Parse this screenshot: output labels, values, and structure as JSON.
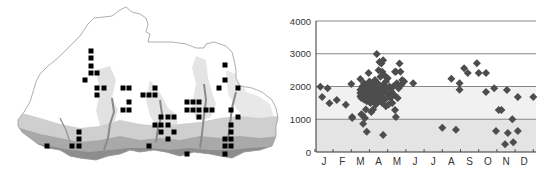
{
  "map": {
    "description": "Distribution map with occurrence grid squares over shaded relief",
    "outline_color": "#9a9a9a",
    "square_color": "#000000",
    "square_size": 5,
    "squares": [
      [
        91,
        51
      ],
      [
        91,
        58
      ],
      [
        91,
        66
      ],
      [
        91,
        73
      ],
      [
        97,
        73
      ],
      [
        85,
        80
      ],
      [
        97,
        88
      ],
      [
        104,
        88
      ],
      [
        97,
        95
      ],
      [
        123,
        88
      ],
      [
        129,
        88
      ],
      [
        129,
        102
      ],
      [
        123,
        110
      ],
      [
        129,
        110
      ],
      [
        143,
        95
      ],
      [
        149,
        95
      ],
      [
        155,
        95
      ],
      [
        155,
        88
      ],
      [
        161,
        117
      ],
      [
        168,
        117
      ],
      [
        174,
        117
      ],
      [
        155,
        125
      ],
      [
        161,
        125
      ],
      [
        168,
        125
      ],
      [
        161,
        132
      ],
      [
        174,
        132
      ],
      [
        168,
        139
      ],
      [
        149,
        146
      ],
      [
        187,
        102
      ],
      [
        193,
        102
      ],
      [
        199,
        102
      ],
      [
        187,
        110
      ],
      [
        193,
        110
      ],
      [
        199,
        110
      ],
      [
        206,
        110
      ],
      [
        212,
        110
      ],
      [
        199,
        117
      ],
      [
        187,
        154
      ],
      [
        225,
        65
      ],
      [
        225,
        80
      ],
      [
        219,
        88
      ],
      [
        238,
        88
      ],
      [
        231,
        110
      ],
      [
        238,
        117
      ],
      [
        231,
        125
      ],
      [
        231,
        132
      ],
      [
        225,
        139
      ],
      [
        231,
        139
      ],
      [
        225,
        146
      ],
      [
        231,
        146
      ],
      [
        225,
        154
      ],
      [
        79,
        132
      ],
      [
        79,
        139
      ],
      [
        79,
        146
      ],
      [
        72,
        146
      ],
      [
        47,
        146
      ]
    ]
  },
  "chart_data": {
    "type": "scatter",
    "title": "",
    "xlabel": "",
    "ylabel": "",
    "categories": [
      "J",
      "F",
      "M",
      "A",
      "M",
      "J",
      "J",
      "A",
      "S",
      "O",
      "N",
      "D"
    ],
    "yticks": [
      "0",
      "1000",
      "2000",
      "3000",
      "4000"
    ],
    "ylim": [
      0,
      4000
    ],
    "grid": true,
    "bands": [
      {
        "from": 0,
        "to": 1000,
        "color": "#e4e4e4"
      },
      {
        "from": 1000,
        "to": 2000,
        "color": "#f1f1f1"
      }
    ],
    "marker": "diamond",
    "marker_color": "#4d4d4d",
    "series": [
      {
        "name": "records",
        "points": [
          [
            -0.2,
            1990
          ],
          [
            -0.1,
            1680
          ],
          [
            0.2,
            1950
          ],
          [
            0.3,
            1490
          ],
          [
            0.7,
            1590
          ],
          [
            1.2,
            1440
          ],
          [
            1.5,
            2080
          ],
          [
            1.55,
            1040
          ],
          [
            2.0,
            2230
          ],
          [
            2.45,
            2410
          ],
          [
            2.9,
            2990
          ],
          [
            2.0,
            1900
          ],
          [
            2.0,
            1800
          ],
          [
            2.0,
            1700
          ],
          [
            2.05,
            1650
          ],
          [
            2.1,
            2000
          ],
          [
            2.1,
            1850
          ],
          [
            2.15,
            1750
          ],
          [
            2.2,
            1600
          ],
          [
            2.2,
            2100
          ],
          [
            2.25,
            1950
          ],
          [
            2.3,
            1800
          ],
          [
            2.3,
            1700
          ],
          [
            2.35,
            1550
          ],
          [
            2.4,
            2050
          ],
          [
            2.4,
            1900
          ],
          [
            2.45,
            1650
          ],
          [
            2.5,
            1800
          ],
          [
            2.5,
            2150
          ],
          [
            2.55,
            1500
          ],
          [
            2.6,
            1950
          ],
          [
            2.6,
            1700
          ],
          [
            2.65,
            1850
          ],
          [
            2.7,
            2050
          ],
          [
            2.7,
            1600
          ],
          [
            2.75,
            1750
          ],
          [
            2.8,
            1950
          ],
          [
            2.8,
            2200
          ],
          [
            2.85,
            1450
          ],
          [
            2.9,
            1850
          ],
          [
            2.9,
            1650
          ],
          [
            2.95,
            2100
          ],
          [
            3.0,
            2500
          ],
          [
            3.0,
            1800
          ],
          [
            3.0,
            1550
          ],
          [
            3.05,
            2750
          ],
          [
            3.1,
            1950
          ],
          [
            3.1,
            2300
          ],
          [
            3.15,
            2700
          ],
          [
            3.15,
            1700
          ],
          [
            3.2,
            2450
          ],
          [
            3.2,
            1500
          ],
          [
            3.25,
            2800
          ],
          [
            3.25,
            2050
          ],
          [
            3.3,
            1850
          ],
          [
            3.3,
            2350
          ],
          [
            3.35,
            1600
          ],
          [
            3.4,
            2150
          ],
          [
            3.4,
            1400
          ],
          [
            3.45,
            1950
          ],
          [
            3.5,
            2250
          ],
          [
            3.5,
            1750
          ],
          [
            3.55,
            1450
          ],
          [
            3.6,
            2000
          ],
          [
            3.65,
            1650
          ],
          [
            3.7,
            1850
          ],
          [
            3.75,
            1500
          ],
          [
            3.8,
            2000
          ],
          [
            3.85,
            1750
          ],
          [
            3.9,
            2450
          ],
          [
            3.95,
            2450
          ],
          [
            4.0,
            2100
          ],
          [
            4.05,
            1650
          ],
          [
            4.1,
            1950
          ],
          [
            4.15,
            2700
          ],
          [
            4.2,
            2450
          ],
          [
            4.25,
            2050
          ],
          [
            4.3,
            2200
          ],
          [
            4.4,
            2150
          ],
          [
            4.9,
            2100
          ],
          [
            1.55,
            1070
          ],
          [
            2.1,
            1130
          ],
          [
            2.25,
            1040
          ],
          [
            2.15,
            860
          ],
          [
            2.35,
            620
          ],
          [
            3.25,
            520
          ],
          [
            3.95,
            1070
          ],
          [
            3.9,
            1280
          ],
          [
            2.6,
            1220
          ],
          [
            2.7,
            1300
          ],
          [
            2.3,
            1300
          ],
          [
            2.05,
            1150
          ],
          [
            6.5,
            740
          ],
          [
            7.0,
            2240
          ],
          [
            7.25,
            680
          ],
          [
            7.45,
            2100
          ],
          [
            7.45,
            1900
          ],
          [
            7.7,
            2560
          ],
          [
            7.9,
            2410
          ],
          [
            8.4,
            2710
          ],
          [
            8.5,
            2410
          ],
          [
            8.9,
            2410
          ],
          [
            8.9,
            1830
          ],
          [
            9.35,
            1950
          ],
          [
            9.45,
            640
          ],
          [
            9.6,
            1280
          ],
          [
            9.75,
            1280
          ],
          [
            10.05,
            1890
          ],
          [
            9.95,
            240
          ],
          [
            10.1,
            580
          ],
          [
            10.35,
            1000
          ],
          [
            10.4,
            300
          ],
          [
            10.65,
            1680
          ],
          [
            10.65,
            640
          ],
          [
            11.5,
            1680
          ]
        ]
      }
    ]
  }
}
